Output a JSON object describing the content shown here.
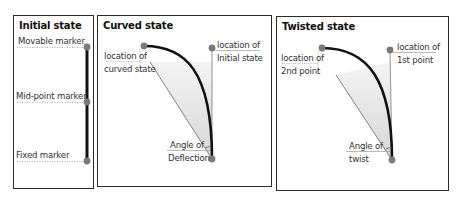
{
  "panels": [
    {
      "title": "Initial state",
      "labels": {
        "movable": "Movable marker",
        "midpoint": "Mid-point marker",
        "fixed": "Fixed marker"
      }
    },
    {
      "title": "Curved state",
      "labels": {
        "curved_line1": "location of",
        "curved_line2": "curved state",
        "initial_line1": "location of",
        "initial_line2": "Initial state",
        "angle_line1": "Angle of",
        "angle_line2": "Deflection"
      }
    },
    {
      "title": "Twisted state",
      "labels": {
        "second_line1": "location of",
        "second_line2": "2nd point",
        "first_line1": "location of",
        "first_line2": "1st point",
        "angle_line1": "Angle of",
        "angle_line2": "twist"
      }
    }
  ],
  "colors": {
    "marker": "#7a7a7a",
    "rod": "#111111",
    "shade": "#d9d9d9",
    "border": "#2a2a2a"
  }
}
